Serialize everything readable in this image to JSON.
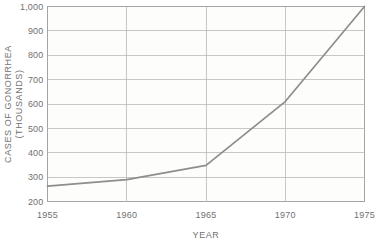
{
  "chart_data": {
    "type": "line",
    "title": "",
    "xlabel": "YEAR",
    "ylabel": "CASES OF GONORRHEA (THOUSANDS)",
    "ylabel_line1": "CASES OF GONORRHEA",
    "ylabel_line2": "(THOUSANDS)",
    "x": [
      1955,
      1960,
      1965,
      1970,
      1975
    ],
    "values": [
      263,
      290,
      348,
      610,
      1000
    ],
    "series": [
      {
        "name": "Cases of gonorrhea",
        "values": [
          263,
          290,
          348,
          610,
          1000
        ]
      }
    ],
    "xlim": [
      1955,
      1975
    ],
    "ylim": [
      200,
      1000
    ],
    "xticks": [
      1955,
      1960,
      1965,
      1970,
      1975
    ],
    "xtick_labels": [
      "1955",
      "1960",
      "1965",
      "1970",
      "1975"
    ],
    "yticks": [
      200,
      300,
      400,
      500,
      600,
      700,
      800,
      900,
      1000
    ],
    "ytick_labels": [
      "200",
      "300",
      "400",
      "500",
      "600",
      "700",
      "800",
      "900",
      "1,000"
    ],
    "grid": true,
    "legend": false,
    "line_color": "#8d8d8d",
    "grid_color": "#b9b9b9",
    "frame_color": "#9a9a9a",
    "plot_background": "#fdfdfb",
    "text_color": "#717171"
  }
}
